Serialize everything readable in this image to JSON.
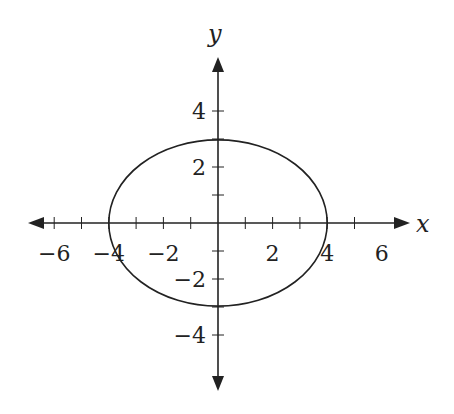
{
  "chart_data": {
    "type": "line",
    "title": "",
    "xlabel": "x",
    "ylabel": "y",
    "xlim": [
      -7,
      7
    ],
    "ylim": [
      -6,
      6
    ],
    "grid": false,
    "x_ticks": [
      -6,
      -5,
      -4,
      -3,
      -2,
      -1,
      1,
      2,
      3,
      4,
      5
    ],
    "y_ticks": [
      -4,
      -3,
      -2,
      -1,
      1,
      2,
      3,
      4
    ],
    "x_tick_labels": [
      "−6",
      "−4",
      "−2",
      "2",
      "4",
      "6"
    ],
    "y_tick_labels": [
      "4",
      "2",
      "−2",
      "−4"
    ],
    "series": [
      {
        "name": "ellipse",
        "equation": "x^2/16 + y^2/9 = 1",
        "center": [
          0,
          0
        ],
        "semi_axis_x": 4,
        "semi_axis_y": 3,
        "intercepts": [
          [
            -4,
            0
          ],
          [
            4,
            0
          ],
          [
            0,
            3
          ],
          [
            0,
            -3
          ]
        ]
      }
    ]
  },
  "labels": {
    "x_axis": "x",
    "y_axis": "y",
    "xticks": [
      {
        "v": -6,
        "t": "−6"
      },
      {
        "v": -4,
        "t": "−4"
      },
      {
        "v": -2,
        "t": "−2"
      },
      {
        "v": 2,
        "t": "2"
      },
      {
        "v": 4,
        "t": "4"
      },
      {
        "v": 6,
        "t": "6"
      }
    ],
    "yticks": [
      {
        "v": 4,
        "t": "4"
      },
      {
        "v": 2,
        "t": "2"
      },
      {
        "v": -2,
        "t": "−2"
      },
      {
        "v": -4,
        "t": "−4"
      }
    ]
  }
}
